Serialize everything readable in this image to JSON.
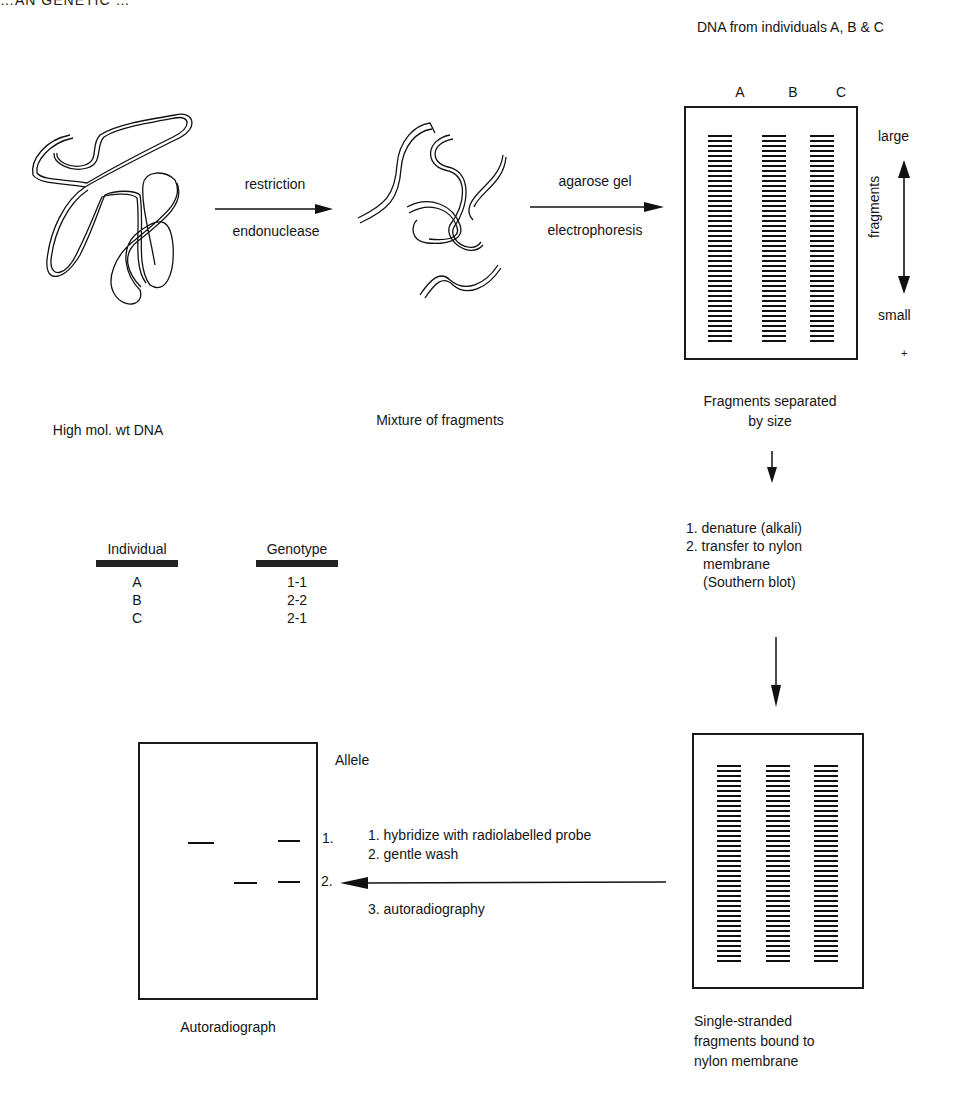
{
  "header": {
    "text": "…AN GENETIC …"
  },
  "steps": {
    "dna": {
      "caption": "High mol. wt DNA"
    },
    "restriction_arrow": {
      "label_top": "restriction",
      "label_bottom": "endonuclease"
    },
    "fragments": {
      "caption": "Mixture of fragments"
    },
    "electrophoresis_arrow": {
      "label_top": "agarose gel",
      "label_bottom": "electrophoresis"
    },
    "gel": {
      "title": "DNA from individuals A, B & C",
      "lanes": [
        "A",
        "B",
        "C"
      ],
      "size_axis": {
        "top": "large",
        "label": "fragments",
        "bottom": "small",
        "mark": "+"
      },
      "caption_line1": "Fragments separated",
      "caption_line2": "by size"
    },
    "southern": {
      "step1": "1. denature (alkali)",
      "step2_line1": "2. transfer to nylon",
      "step2_line2": "membrane",
      "step2_line3": "(Southern blot)"
    },
    "membrane": {
      "caption_line1": "Single-stranded",
      "caption_line2": "fragments bound to",
      "caption_line3": "nylon membrane"
    },
    "hybridize": {
      "step1": "1. hybridize with radiolabelled probe",
      "step2": "2. gentle wash",
      "step3": "3. autoradiography"
    },
    "autorad": {
      "caption": "Autoradiograph",
      "allele_header": "Allele",
      "allele_1": "1.",
      "allele_2": "2."
    }
  },
  "genotype_table": {
    "headers": [
      "Individual",
      "Genotype"
    ],
    "rows": [
      {
        "individual": "A",
        "genotype": "1-1"
      },
      {
        "individual": "B",
        "genotype": "2-2"
      },
      {
        "individual": "C",
        "genotype": "2-1"
      }
    ]
  }
}
